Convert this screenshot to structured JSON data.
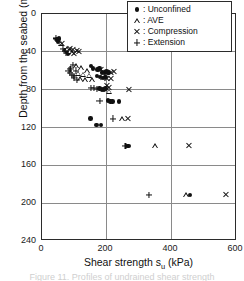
{
  "figure": {
    "caption": "Figure 11. Profiles of undrained shear strength"
  },
  "chart_data": {
    "type": "scatter",
    "title": "",
    "xlabel": "Shear strength  s",
    "xlabel_sub": "u",
    "xlabel_unit": " (kPa)",
    "xlabel_full": "Shear strength  su (kPa)",
    "ylabel": "Depth from the seabed (m)",
    "xlim": [
      0,
      600
    ],
    "ylim": [
      0,
      240
    ],
    "y_inverted": true,
    "xticks": [
      0,
      200,
      400,
      600
    ],
    "yticks": [
      0,
      40,
      80,
      120,
      160,
      200,
      240
    ],
    "xtick_labels": [
      "0",
      "200",
      "400",
      "600"
    ],
    "ytick_labels": [
      "0",
      "40",
      "80",
      "120",
      "160",
      "200",
      "240"
    ],
    "grid": "both",
    "gridlines_x": [
      200,
      400
    ],
    "gridlines_y": [
      40,
      80,
      120,
      160,
      200
    ],
    "legend_position": "top-right",
    "legend": [
      {
        "marker": "filled-circle",
        "prefix": ":",
        "label": "Unconfined"
      },
      {
        "marker": "open-triangle",
        "prefix": ":",
        "label": "AVE"
      },
      {
        "marker": "cross-x",
        "prefix": ":",
        "label": "Compression"
      },
      {
        "marker": "plus",
        "prefix": ":",
        "label": "Extension"
      }
    ],
    "series": [
      {
        "name": "Unconfined",
        "marker": "filled-circle",
        "points": [
          [
            46,
            27
          ],
          [
            50,
            29
          ],
          [
            52,
            26
          ],
          [
            72,
            38
          ],
          [
            78,
            40
          ],
          [
            84,
            40
          ],
          [
            80,
            42
          ],
          [
            152,
            55
          ],
          [
            158,
            58
          ],
          [
            172,
            59
          ],
          [
            178,
            58
          ],
          [
            186,
            62
          ],
          [
            194,
            62
          ],
          [
            200,
            61
          ],
          [
            206,
            62
          ],
          [
            170,
            66
          ],
          [
            180,
            67
          ],
          [
            188,
            68
          ],
          [
            196,
            67
          ],
          [
            178,
            79
          ],
          [
            186,
            80
          ],
          [
            192,
            80
          ],
          [
            196,
            79
          ],
          [
            204,
            92
          ],
          [
            212,
            93
          ],
          [
            218,
            93
          ],
          [
            238,
            93
          ],
          [
            150,
            111
          ],
          [
            168,
            118
          ],
          [
            182,
            118
          ],
          [
            262,
            140
          ],
          [
            268,
            140
          ],
          [
            458,
            192
          ]
        ]
      },
      {
        "name": "AVE",
        "marker": "open-triangle",
        "points": [
          [
            58,
            31
          ],
          [
            76,
            37
          ],
          [
            86,
            39
          ],
          [
            92,
            41
          ],
          [
            104,
            55
          ],
          [
            120,
            57
          ],
          [
            138,
            60
          ],
          [
            112,
            63
          ],
          [
            126,
            64
          ],
          [
            146,
            65
          ],
          [
            118,
            69
          ],
          [
            132,
            70
          ],
          [
            154,
            70
          ],
          [
            208,
            82
          ],
          [
            246,
            111
          ],
          [
            350,
            140
          ],
          [
            446,
            192
          ]
        ]
      },
      {
        "name": "Compression",
        "marker": "cross-x",
        "points": [
          [
            62,
            31
          ],
          [
            88,
            37
          ],
          [
            96,
            38
          ],
          [
            108,
            39
          ],
          [
            114,
            40
          ],
          [
            100,
            42
          ],
          [
            182,
            59
          ],
          [
            198,
            62
          ],
          [
            212,
            62
          ],
          [
            222,
            61
          ],
          [
            190,
            67
          ],
          [
            202,
            68
          ],
          [
            214,
            68
          ],
          [
            200,
            76
          ],
          [
            206,
            78
          ],
          [
            268,
            80
          ],
          [
            266,
            111
          ],
          [
            456,
            140
          ],
          [
            568,
            192
          ]
        ]
      },
      {
        "name": "Extension",
        "marker": "plus",
        "points": [
          [
            44,
            26
          ],
          [
            48,
            28
          ],
          [
            66,
            37
          ],
          [
            70,
            39
          ],
          [
            74,
            41
          ],
          [
            96,
            54
          ],
          [
            88,
            58
          ],
          [
            82,
            60
          ],
          [
            104,
            60
          ],
          [
            86,
            63
          ],
          [
            92,
            65
          ],
          [
            98,
            66
          ],
          [
            100,
            68
          ],
          [
            108,
            70
          ],
          [
            152,
            79
          ],
          [
            160,
            79
          ],
          [
            170,
            80
          ],
          [
            178,
            92
          ],
          [
            220,
            111
          ],
          [
            258,
            140
          ],
          [
            330,
            192
          ]
        ]
      }
    ]
  }
}
